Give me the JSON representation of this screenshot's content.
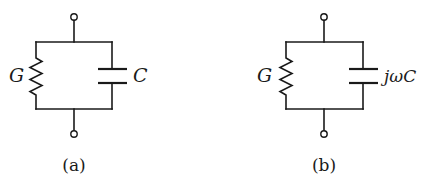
{
  "figure": {
    "type": "circuit-diagram",
    "panels": [
      {
        "id": "a",
        "caption": "(a)",
        "components": [
          {
            "kind": "resistor",
            "label": "G"
          },
          {
            "kind": "capacitor",
            "label": "C"
          }
        ],
        "topology": "parallel",
        "terminals": 2
      },
      {
        "id": "b",
        "caption": "(b)",
        "components": [
          {
            "kind": "resistor",
            "label": "G"
          },
          {
            "kind": "capacitor",
            "label": "jωC"
          }
        ],
        "topology": "parallel",
        "terminals": 2
      }
    ]
  },
  "colors": {
    "line": "#1a1a1a",
    "background": "#ffffff"
  }
}
